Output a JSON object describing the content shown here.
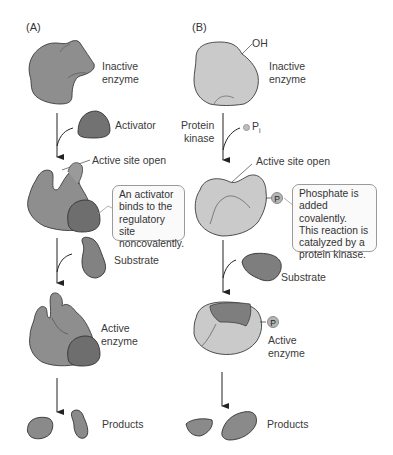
{
  "panel_a": {
    "tag": "(A)",
    "inactive_label_1": "Inactive",
    "inactive_label_2": "enzyme",
    "activator_label": "Activator",
    "active_site_label": "Active site open",
    "callout": [
      "An activator",
      "binds to the",
      "regulatory site",
      "noncovalently."
    ],
    "substrate_label": "Substrate",
    "active_label_1": "Active",
    "active_label_2": "enzyme",
    "products_label": "Products"
  },
  "panel_b": {
    "tag": "(B)",
    "oh_label": "OH",
    "inactive_label_1": "Inactive",
    "inactive_label_2": "enzyme",
    "kinase_label_1": "Protein",
    "kinase_label_2": "kinase",
    "pi_label": "P",
    "pi_subscript": "i",
    "active_site_label": "Active site open",
    "phosphate_badge": "P",
    "callout": [
      "Phosphate is",
      "added covalently.",
      "This reaction is",
      "catalyzed by a",
      "protein kinase."
    ],
    "substrate_label": "Substrate",
    "active_label_1": "Active",
    "active_label_2": "enzyme",
    "products_label": "Products"
  },
  "colors": {
    "enzyme_dark": "#8c8c8c",
    "enzyme_darker": "#6f6f6f",
    "enzyme_light": "#c9c9c9",
    "outline": "#3c3c3c",
    "callout_border": "#9a9a9a"
  }
}
